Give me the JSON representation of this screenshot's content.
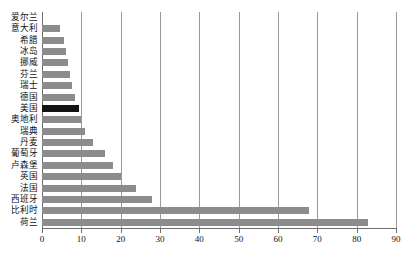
{
  "chart_data": {
    "type": "bar",
    "orientation": "horizontal",
    "title": "",
    "xlabel": "",
    "ylabel": "",
    "xlim": [
      0,
      90
    ],
    "xticks": [
      0,
      10,
      20,
      30,
      40,
      50,
      60,
      70,
      80,
      90
    ],
    "grid": true,
    "grid_axis": "x",
    "legend": false,
    "bar_color": "#8c8c8c",
    "highlight_color": "#141414",
    "highlight_category": "美国",
    "categories": [
      "爱尔兰",
      "意大利",
      "希腊",
      "冰岛",
      "挪威",
      "芬兰",
      "瑞士",
      "德国",
      "美国",
      "奥地利",
      "瑞典",
      "丹麦",
      "葡萄牙",
      "卢森堡",
      "英国",
      "法国",
      "西班牙",
      "比利时",
      "荷兰"
    ],
    "values": [
      0,
      4.5,
      5.5,
      6,
      6.5,
      7,
      7.5,
      8.5,
      9.5,
      10,
      11,
      13,
      16,
      18,
      20,
      24,
      28,
      68,
      83
    ]
  }
}
